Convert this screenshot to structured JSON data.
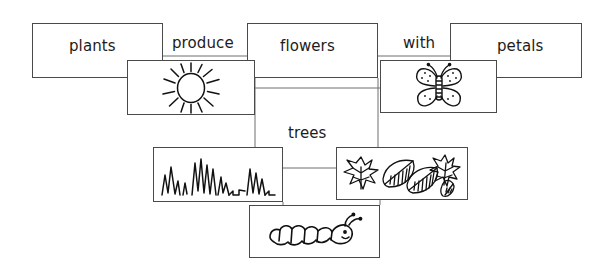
{
  "diagram": {
    "background_color": "#ffffff",
    "box_border_color": "#4a4a4a",
    "connector_color": "#6e6e6e",
    "text_color": "#1c1c1c",
    "sketch_ink_color": "#111111",
    "width": 614,
    "height": 271
  },
  "text_boxes": [
    {
      "id": "plants",
      "label": "plants",
      "x": 32,
      "y": 23,
      "w": 131,
      "h": 55,
      "label_x": 69,
      "label_y": 39
    },
    {
      "id": "flowers",
      "label": "flowers",
      "x": 247,
      "y": 23,
      "w": 131,
      "h": 55,
      "label_x": 280,
      "label_y": 39
    },
    {
      "id": "petals",
      "label": "petals",
      "x": 450,
      "y": 23,
      "w": 132,
      "h": 55,
      "label_x": 497,
      "label_y": 39
    }
  ],
  "picture_boxes": [
    {
      "id": "sun",
      "icon": "sun-sketch",
      "x": 127,
      "y": 60,
      "w": 128,
      "h": 55
    },
    {
      "id": "butterfly",
      "icon": "butterfly-sketch",
      "x": 380,
      "y": 60,
      "w": 117,
      "h": 53
    },
    {
      "id": "grass",
      "icon": "grass-sketch",
      "x": 153,
      "y": 147,
      "w": 130,
      "h": 55
    },
    {
      "id": "leaves",
      "icon": "leaves-sketch",
      "x": 336,
      "y": 147,
      "w": 132,
      "h": 53
    },
    {
      "id": "caterpillar",
      "icon": "caterpillar-sketch",
      "x": 249,
      "y": 205,
      "w": 131,
      "h": 53
    }
  ],
  "link_labels": [
    {
      "id": "produce",
      "label": "produce",
      "x": 172,
      "y": 36
    },
    {
      "id": "with",
      "label": "with",
      "x": 403,
      "y": 36
    },
    {
      "id": "trees",
      "label": "trees",
      "x": 288,
      "y": 126
    }
  ],
  "connectors": [
    {
      "id": "plants-to-flowers",
      "d": "M 163 56 L 247 56"
    },
    {
      "id": "flowers-to-petals",
      "d": "M 378 56 L 450 56"
    },
    {
      "id": "sun-to-butterfly",
      "d": "M 255 88 L 380 88"
    },
    {
      "id": "flowers-down-left",
      "d": "M 255 78 L 255 147"
    },
    {
      "id": "flowers-down-right",
      "d": "M 378 78 L 378 147"
    },
    {
      "id": "grass-to-leaves",
      "d": "M 283 168 L 336 168"
    },
    {
      "id": "grass-to-caterpillar",
      "d": "M 283 202 L 283 205"
    },
    {
      "id": "leaves-to-caterpillar",
      "d": "M 380 200 L 380 205"
    }
  ]
}
